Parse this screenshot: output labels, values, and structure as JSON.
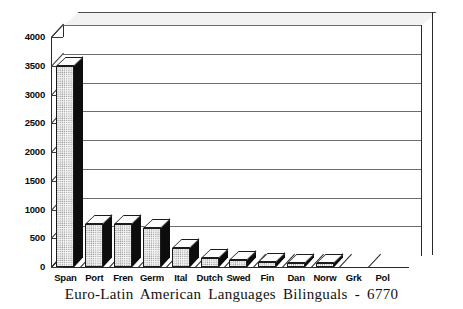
{
  "chart_data": {
    "type": "bar",
    "title": "Euro-Latin American Languages Bilinguals - 6770",
    "xlabel": "",
    "ylabel": "",
    "ylim": [
      0,
      4000
    ],
    "grid": true,
    "legend": "none",
    "style": "3d-column",
    "categories": [
      "Span",
      "Port",
      "Fren",
      "Germ",
      "Ital",
      "Dutch",
      "Swed",
      "Fin",
      "Dan",
      "Norw",
      "Grk",
      "Pol"
    ],
    "values": [
      3500,
      750,
      750,
      680,
      330,
      150,
      120,
      90,
      70,
      70,
      0,
      0
    ],
    "ticks": [
      "0",
      "500",
      "1000",
      "1500",
      "2000",
      "2500",
      "3000",
      "3500",
      "4000"
    ],
    "tick_values": [
      0,
      500,
      1000,
      1500,
      2000,
      2500,
      3000,
      3500,
      4000
    ],
    "total": "6770",
    "colors": {
      "bar_face": "#f4f4f4",
      "bar_side": "#0d0d0d",
      "bar_top": "#fdfdfd",
      "outline": "#1b1b1b",
      "gridline": "#6d6d6d",
      "background": "#ffffff",
      "text": "#0a0a0a"
    }
  }
}
